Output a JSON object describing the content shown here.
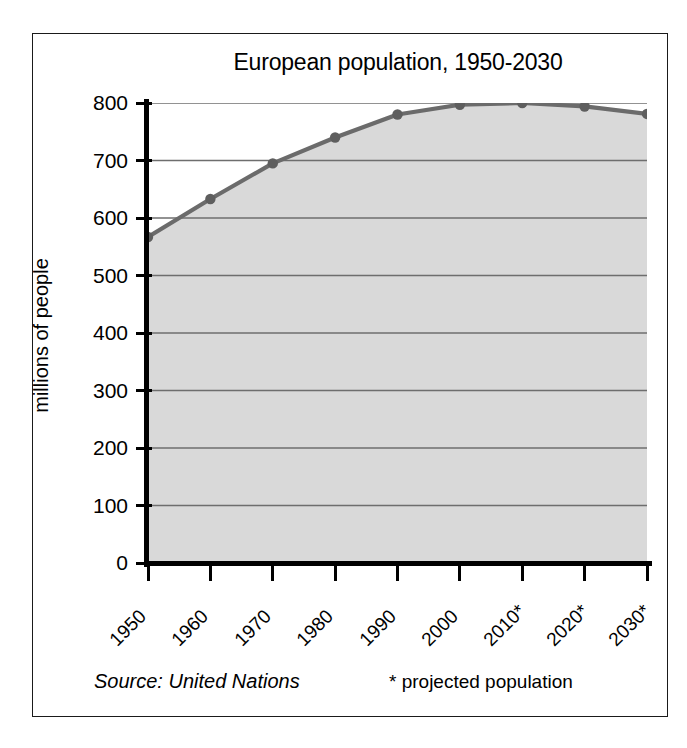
{
  "chart_data": {
    "type": "area",
    "title": "European population, 1950-2030",
    "xlabel": "",
    "ylabel": "millions of people",
    "categories": [
      "1950",
      "1960",
      "1970",
      "1980",
      "1990",
      "2000",
      "2010*",
      "2020*",
      "2030*"
    ],
    "values": [
      567,
      633,
      695,
      740,
      780,
      797,
      800,
      794,
      781
    ],
    "ylim": [
      0,
      800
    ],
    "ytick_labels": [
      "800",
      "700",
      "600",
      "500",
      "400",
      "300",
      "200",
      "100",
      "0"
    ],
    "ytick_values": [
      800,
      700,
      600,
      500,
      400,
      300,
      200,
      100,
      0
    ],
    "grid": true,
    "legend": "none",
    "series": [
      {
        "name": "European population",
        "values": [
          567,
          633,
          695,
          740,
          780,
          797,
          800,
          794,
          781
        ]
      }
    ],
    "annotations": {
      "source": "Source: United Nations",
      "projection_note": "* projected population"
    },
    "colors": {
      "line": "#6b6b6b",
      "marker": "#5e5e5e",
      "fill": "#d9d9d9",
      "gridline": "#6e6e6e",
      "axis": "#000000",
      "frame": "#1a1a1a",
      "background": "#ffffff"
    }
  },
  "footer": {
    "source": "Source: United Nations",
    "projection_note": "* projected population"
  }
}
